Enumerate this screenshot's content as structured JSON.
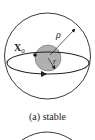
{
  "figure": {
    "caption": "(a) stable",
    "labels": {
      "initial_point": "X",
      "initial_point_subscript": "0",
      "outer_radius": "ρ",
      "inner_radius": "r"
    },
    "colors": {
      "stroke": "#222222",
      "inner_disk": "#b0b0b0",
      "background": "#ffffff"
    }
  }
}
